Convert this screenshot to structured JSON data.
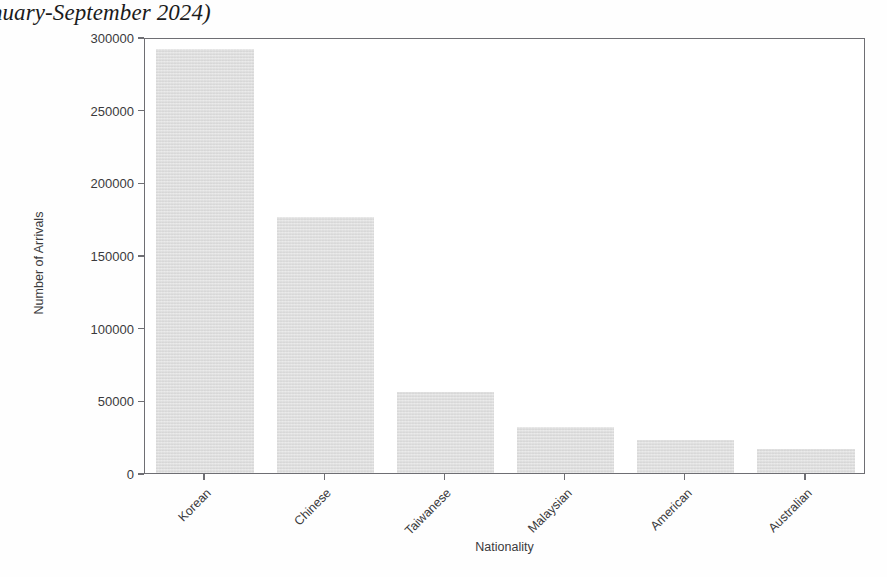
{
  "chart_data": {
    "type": "bar",
    "title": "ality (January-September 2024)",
    "title_note": "title is clipped at the left edge of the page",
    "xlabel": "Nationality",
    "ylabel": "Number of Arrivals",
    "categories": [
      "Korean",
      "Chinese",
      "Taiwanese",
      "Malaysian",
      "American",
      "Australian"
    ],
    "values": [
      291700,
      176200,
      55700,
      31600,
      22700,
      16500
    ],
    "ylim": [
      0,
      300000
    ],
    "ytick_labels": [
      "0",
      "50000",
      "100000",
      "150000",
      "200000",
      "250000",
      "300000"
    ],
    "ytick_values": [
      0,
      50000,
      100000,
      150000,
      200000,
      250000,
      300000
    ],
    "grid": false,
    "legend": false,
    "bar_color": "#dcdcdc",
    "axis_color": "#6e6e73",
    "background": "#ffffff",
    "xtick_rotation_degrees": -45
  }
}
